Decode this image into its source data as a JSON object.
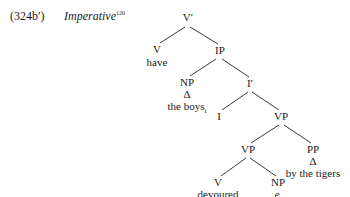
{
  "example": {
    "number": "(324b′)",
    "title": "Imperative",
    "footnote": "120"
  },
  "tree": {
    "root": "V′",
    "nodes": {
      "vbar": "V′",
      "v_top": "V",
      "v_top_word": "have",
      "ip": "IP",
      "np_subj": "NP",
      "np_subj_delta": "Δ",
      "np_subj_word": "the boys",
      "np_subj_index": "i",
      "ibar": "I′",
      "i": "I",
      "vp_upper": "VP",
      "vp_lower": "VP",
      "pp": "PP",
      "pp_delta": "Δ",
      "pp_word": "by the tigers",
      "v_low": "V",
      "v_low_word": "devoured",
      "np_obj": "NP",
      "np_obj_trace": "e",
      "np_obj_index": "i"
    }
  }
}
